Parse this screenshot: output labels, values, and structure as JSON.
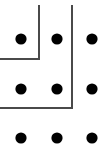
{
  "figure": {
    "width": 109,
    "height": 153,
    "background_color": "#ffffff"
  },
  "chart_data": {
    "type": "scatter",
    "title": "",
    "xlabel": "",
    "ylabel": "",
    "xlim": [
      0,
      109
    ],
    "ylim": [
      153,
      0
    ],
    "grid": false,
    "legend": null,
    "point_color": "#000000",
    "point_radius": 5.6,
    "columns_x": [
      21,
      57,
      92
    ],
    "rows_y": [
      39,
      89,
      138
    ],
    "points": [
      {
        "id": "dot-r1-c1",
        "x": 21,
        "y": 39
      },
      {
        "id": "dot-r1-c2",
        "x": 57,
        "y": 39
      },
      {
        "id": "dot-r1-c3",
        "x": 92,
        "y": 39
      },
      {
        "id": "dot-r2-c1",
        "x": 21,
        "y": 89
      },
      {
        "id": "dot-r2-c2",
        "x": 57,
        "y": 89
      },
      {
        "id": "dot-r2-c3",
        "x": 92,
        "y": 89
      },
      {
        "id": "dot-r3-c1",
        "x": 21,
        "y": 138
      },
      {
        "id": "dot-r3-c2",
        "x": 57,
        "y": 138
      },
      {
        "id": "dot-r3-c3",
        "x": 92,
        "y": 138
      }
    ],
    "annotations": [
      {
        "id": "wall-upper-left",
        "shape": "polyline",
        "stroke_color": "#4a4a4a",
        "stroke_width": 2,
        "path": "M 39 5 L 39 59 L 0 59"
      },
      {
        "id": "wall-lower-right",
        "shape": "polyline",
        "stroke_color": "#4a4a4a",
        "stroke_width": 2,
        "path": "M 72 5 L 72 108 L 0 108"
      }
    ]
  }
}
